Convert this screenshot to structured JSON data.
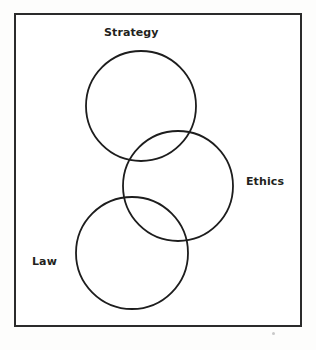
{
  "figure": {
    "background_color": "#fdfdfc",
    "frame": {
      "border_color": "#2b2b2b",
      "border_width_px": 2,
      "fill_color": "#ffffff",
      "x": 14,
      "y": 13,
      "width": 288,
      "height": 314
    }
  },
  "chart_data": {
    "type": "diagram",
    "subtype": "venn",
    "title": "",
    "stroke_color": "#1d1d1d",
    "fill": "none",
    "sets": [
      {
        "name": "strategy",
        "label": "Strategy",
        "cx": 141,
        "cy": 106,
        "r": 55,
        "label_position": "above"
      },
      {
        "name": "ethics",
        "label": "Ethics",
        "cx": 178,
        "cy": 186,
        "r": 55,
        "label_position": "right"
      },
      {
        "name": "law",
        "label": "Law",
        "cx": 132,
        "cy": 253,
        "r": 56,
        "label_position": "left"
      }
    ],
    "overlaps": [
      {
        "sets": [
          "strategy",
          "ethics"
        ],
        "labeled": false
      },
      {
        "sets": [
          "ethics",
          "law"
        ],
        "labeled": false
      }
    ],
    "non_overlapping": [
      {
        "sets": [
          "strategy",
          "law"
        ]
      }
    ]
  },
  "labels": {
    "strategy": "Strategy",
    "ethics": "Ethics",
    "law": "Law"
  }
}
